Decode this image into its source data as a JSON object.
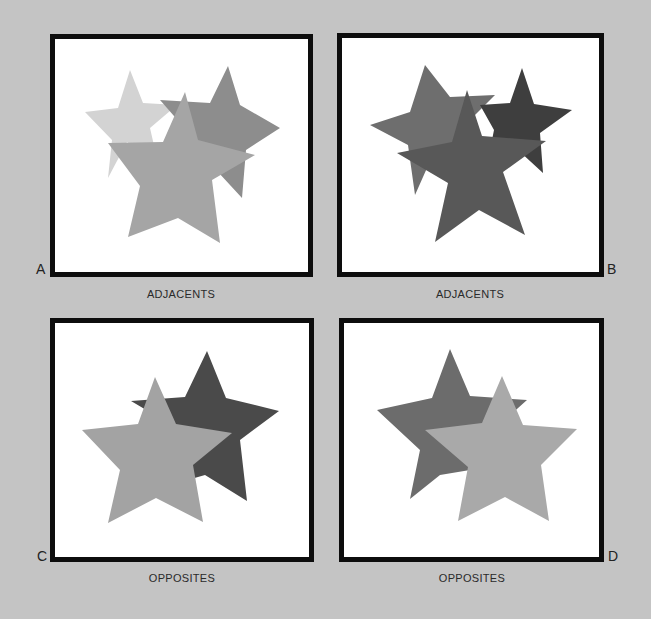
{
  "panels": [
    {
      "id": "A",
      "letter": "A",
      "caption": "ADJACENTS",
      "frame": {
        "x": 50,
        "y": 34,
        "w": 263,
        "h": 243
      },
      "stars": [
        {
          "name": "light-star",
          "color": "#d3d3d3",
          "points": [
            [
              130,
              70
            ],
            [
              143,
              103
            ],
            [
              177,
              105
            ],
            [
              150,
              128
            ],
            [
              158,
              163
            ],
            [
              127,
              142
            ],
            [
              108,
              178
            ],
            [
              112,
              140
            ],
            [
              85,
              112
            ],
            [
              118,
              108
            ]
          ]
        },
        {
          "name": "medium-dark-star",
          "color": "#8d8d8d",
          "points": [
            [
              228,
              66
            ],
            [
              240,
              105
            ],
            [
              280,
              128
            ],
            [
              246,
              150
            ],
            [
              242,
              198
            ],
            [
              218,
              172
            ],
            [
              190,
              180
            ],
            [
              195,
              140
            ],
            [
              160,
              100
            ],
            [
              210,
              103
            ]
          ]
        },
        {
          "name": "front-star",
          "color": "#a5a5a5",
          "points": [
            [
              185,
              92
            ],
            [
              198,
              140
            ],
            [
              255,
              155
            ],
            [
              212,
              180
            ],
            [
              220,
              243
            ],
            [
              178,
              218
            ],
            [
              128,
              237
            ],
            [
              140,
              186
            ],
            [
              108,
              143
            ],
            [
              163,
              142
            ]
          ]
        }
      ]
    },
    {
      "id": "B",
      "letter": "B",
      "caption": "ADJACENTS",
      "frame": {
        "x": 337,
        "y": 33,
        "w": 267,
        "h": 244
      },
      "stars": [
        {
          "name": "medium-star",
          "color": "#6e6e6e",
          "points": [
            [
              425,
              65
            ],
            [
              450,
              97
            ],
            [
              495,
              95
            ],
            [
              462,
              128
            ],
            [
              465,
              160
            ],
            [
              435,
              150
            ],
            [
              415,
              195
            ],
            [
              408,
              145
            ],
            [
              370,
              125
            ],
            [
              410,
              112
            ]
          ]
        },
        {
          "name": "dark-star",
          "color": "#3e3e3e",
          "points": [
            [
              522,
              68
            ],
            [
              534,
              104
            ],
            [
              572,
              110
            ],
            [
              540,
              133
            ],
            [
              543,
              173
            ],
            [
              518,
              150
            ],
            [
              488,
              160
            ],
            [
              494,
              130
            ],
            [
              480,
              105
            ],
            [
              510,
              103
            ]
          ]
        },
        {
          "name": "front-star",
          "color": "#585858",
          "points": [
            [
              467,
              90
            ],
            [
              482,
              136
            ],
            [
              546,
              141
            ],
            [
              503,
              172
            ],
            [
              525,
              235
            ],
            [
              479,
              210
            ],
            [
              435,
              242
            ],
            [
              448,
              183
            ],
            [
              397,
              153
            ],
            [
              452,
              142
            ]
          ]
        }
      ]
    },
    {
      "id": "C",
      "letter": "C",
      "caption": "OPPOSITES",
      "frame": {
        "x": 50,
        "y": 318,
        "w": 264,
        "h": 244
      },
      "stars": [
        {
          "name": "dark-back-star",
          "color": "#4a4a4a",
          "points": [
            [
              207,
              351
            ],
            [
              226,
              398
            ],
            [
              279,
              411
            ],
            [
              240,
              440
            ],
            [
              247,
              501
            ],
            [
              205,
              475
            ],
            [
              170,
              485
            ],
            [
              180,
              430
            ],
            [
              131,
              401
            ],
            [
              185,
              397
            ]
          ]
        },
        {
          "name": "light-front-star",
          "color": "#a3a3a3",
          "points": [
            [
              155,
              377
            ],
            [
              176,
              424
            ],
            [
              232,
              433
            ],
            [
              193,
              465
            ],
            [
              203,
              522
            ],
            [
              156,
              498
            ],
            [
              108,
              523
            ],
            [
              120,
              470
            ],
            [
              82,
              430
            ],
            [
              138,
              424
            ]
          ]
        }
      ]
    },
    {
      "id": "D",
      "letter": "D",
      "caption": "OPPOSITES",
      "frame": {
        "x": 339,
        "y": 318,
        "w": 265,
        "h": 244
      },
      "stars": [
        {
          "name": "dark-back-star",
          "color": "#6c6c6c",
          "points": [
            [
              450,
              349
            ],
            [
              470,
              396
            ],
            [
              527,
              400
            ],
            [
              490,
              433
            ],
            [
              470,
              470
            ],
            [
              440,
              475
            ],
            [
              410,
              499
            ],
            [
              420,
              450
            ],
            [
              377,
              410
            ],
            [
              432,
              398
            ]
          ]
        },
        {
          "name": "light-front-star",
          "color": "#a9a9a9",
          "points": [
            [
              502,
              376
            ],
            [
              523,
              425
            ],
            [
              577,
              429
            ],
            [
              541,
              465
            ],
            [
              549,
              521
            ],
            [
              505,
              497
            ],
            [
              458,
              521
            ],
            [
              468,
              467
            ],
            [
              425,
              430
            ],
            [
              482,
              423
            ]
          ]
        }
      ]
    }
  ],
  "letters_pos": {
    "A": {
      "x": 36,
      "y": 262
    },
    "B": {
      "x": 607,
      "y": 262
    },
    "C": {
      "x": 37,
      "y": 549
    },
    "D": {
      "x": 608,
      "y": 549
    }
  },
  "captions_pos": {
    "A": {
      "x": 81,
      "y": 288
    },
    "B": {
      "x": 370,
      "y": 288
    },
    "C": {
      "x": 82,
      "y": 572
    },
    "D": {
      "x": 372,
      "y": 572
    }
  }
}
